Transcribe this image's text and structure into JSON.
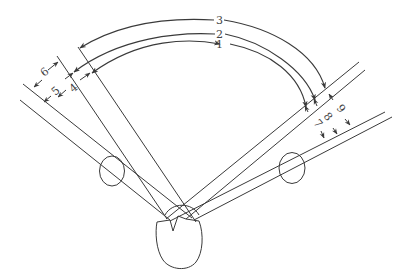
{
  "diagram": {
    "type": "visual field angle diagram (binocular view with head and eyes)",
    "colors": {
      "stroke": "#3a3a3a",
      "label": "#444444",
      "background": "#ffffff"
    },
    "arc_labels": [
      "1",
      "2",
      "3"
    ],
    "left_labels": [
      "4",
      "5",
      "6"
    ],
    "right_labels": [
      "7",
      "8",
      "9"
    ],
    "elements": {
      "head": "head-outline",
      "left_eye": "left-eye-circle",
      "right_eye": "right-eye-circle"
    }
  }
}
